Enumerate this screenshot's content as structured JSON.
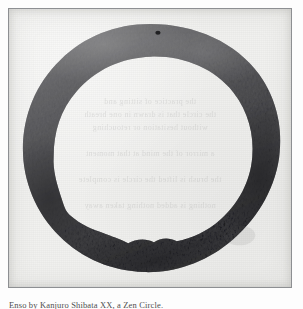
{
  "page": {
    "kind": "scanned-book-plate",
    "background_color": "#fdfdfd"
  },
  "plate": {
    "frame": {
      "border_color": "#8d8f92",
      "paper_color": "#f1f1ef"
    },
    "artwork": {
      "title": "Ensō",
      "medium": "sumi ink on paper",
      "ink_color": "#3b3b3d",
      "ink_light_color": "#6d6d70",
      "ink_dark_color": "#232325",
      "description": "A single broad brush-stroke circle, nearly closed, with dry-brush texture and an inner edge that is irregular and jagged along the lower arc."
    },
    "showthrough_lines": [
      "the practice of sitting and",
      "the circle that is drawn in one breath",
      "without hesitation or retouching",
      "a mirror of the mind at that moment",
      "the brush is lifted the circle is complete",
      "nothing is added nothing taken away"
    ]
  },
  "caption": {
    "text": "Enso by Kanjuro Shibata XX, a Zen Circle."
  }
}
